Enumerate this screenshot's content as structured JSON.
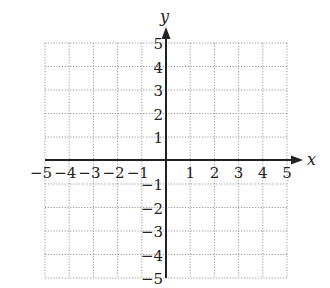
{
  "chart_data": {
    "type": "scatter",
    "title": "",
    "xlabel": "x",
    "ylabel": "y",
    "xlim": [
      -5,
      5
    ],
    "ylim": [
      -5,
      5
    ],
    "grid": true,
    "grid_style": "dotted",
    "x_ticks": [
      -5,
      -4,
      -3,
      -2,
      -1,
      1,
      2,
      3,
      4,
      5
    ],
    "y_ticks": [
      5,
      4,
      3,
      2,
      1,
      -1,
      -2,
      -3,
      -4,
      -5
    ],
    "x_tick_labels": [
      "−5",
      "−4",
      "−3",
      "−2",
      "−1",
      "1",
      "2",
      "3",
      "4",
      "5"
    ],
    "y_tick_labels": [
      "5",
      "4",
      "3",
      "2",
      "1",
      "−1",
      "−2",
      "−3",
      "−4",
      "−5"
    ],
    "series": [],
    "legend": null
  },
  "colors": {
    "axis": "#222222",
    "grid": "#9a9a9a",
    "background": "#ffffff"
  }
}
